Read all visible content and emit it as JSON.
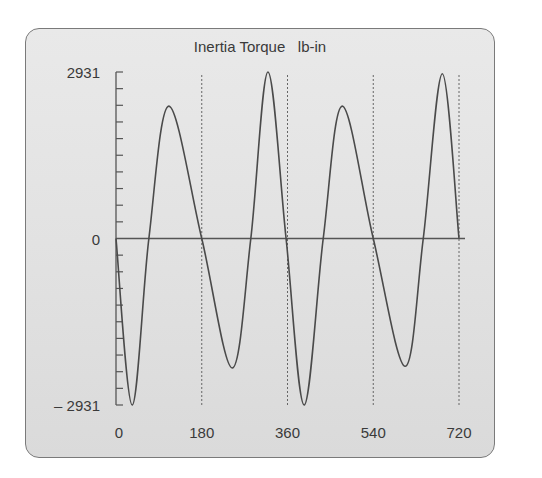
{
  "chart_data": {
    "type": "line",
    "title": "Inertia Torque   lb-in",
    "xlabel": "",
    "ylabel": "",
    "xlim": [
      0,
      720
    ],
    "ylim": [
      -2931,
      2931
    ],
    "x_ticks": [
      0,
      180,
      360,
      540,
      720
    ],
    "x_tick_labels": [
      "0",
      "180",
      "360",
      "540",
      "720"
    ],
    "y_ticks": [
      -2931,
      0,
      2931
    ],
    "y_tick_labels": [
      "– 2931",
      "0",
      "2931"
    ],
    "y_minor_ticks_per_half": 10,
    "vertical_reference_lines": [
      180,
      360,
      540,
      720
    ],
    "grid": false,
    "legend": null,
    "series": [
      {
        "name": "Inertia Torque",
        "x": [
          0,
          34,
          69,
          111,
          180,
          244,
          283,
          319,
          357,
          395,
          435,
          475,
          540,
          607,
          645,
          685,
          720
        ],
        "y": [
          0,
          -2931,
          0,
          2330,
          0,
          -2280,
          0,
          2931,
          0,
          -2931,
          0,
          2330,
          0,
          -2250,
          0,
          2900,
          0
        ]
      }
    ]
  },
  "colors": {
    "panel_background": "#e2e2e2",
    "panel_border": "#7a7a7a",
    "curve": "#4a4a4a",
    "axis": "#555555",
    "text": "#3a3a3a"
  }
}
